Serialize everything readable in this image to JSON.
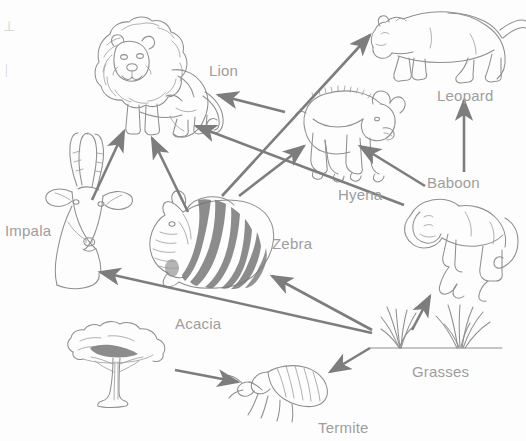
{
  "diagram": {
    "kind": "food-web",
    "width": 526,
    "height": 441,
    "background_color": "#ffffff",
    "line_color": "#7d7d7d",
    "label_color": "#9d9d9d",
    "partial_left_edge_marks": [
      "⊥",
      "|"
    ]
  },
  "labels": {
    "lion": "Lion",
    "leopard": "Leopard",
    "hyena": "Hyena",
    "baboon": "Baboon",
    "impala": "Impala",
    "zebra": "Zebra",
    "acacia": "Acacia",
    "grasses": "Grasses",
    "termite": "Termite"
  },
  "nodes": [
    {
      "id": "lion",
      "label": "Lion",
      "label_x": 209,
      "label_y": 62,
      "art_x": 90,
      "art_y": 18,
      "art_w": 125,
      "art_h": 120
    },
    {
      "id": "leopard",
      "label": "Leopard",
      "label_x": 437,
      "label_y": 87,
      "art_x": 368,
      "art_y": 2,
      "art_w": 150,
      "art_h": 82
    },
    {
      "id": "hyena",
      "label": "Hyena",
      "label_x": 338,
      "label_y": 186,
      "art_x": 305,
      "art_y": 86,
      "art_w": 100,
      "art_h": 95
    },
    {
      "id": "baboon",
      "label": "Baboon",
      "label_x": 427,
      "label_y": 174,
      "art_x": 392,
      "art_y": 192,
      "art_w": 120,
      "art_h": 110
    },
    {
      "id": "impala",
      "label": "Impala",
      "label_x": 5,
      "label_y": 222,
      "art_x": 44,
      "art_y": 170,
      "art_w": 95,
      "art_h": 115
    },
    {
      "id": "zebra",
      "label": "Zebra",
      "label_x": 272,
      "label_y": 235,
      "art_x": 152,
      "art_y": 198,
      "art_w": 115,
      "art_h": 85
    },
    {
      "id": "acacia",
      "label": "Acacia",
      "label_x": 175,
      "label_y": 315,
      "art_x": 64,
      "art_y": 318,
      "art_w": 115,
      "art_h": 85
    },
    {
      "id": "grasses",
      "label": "Grasses",
      "label_x": 412,
      "label_y": 363,
      "art_x": 368,
      "art_y": 310,
      "art_w": 135,
      "art_h": 80
    },
    {
      "id": "termite",
      "label": "Termite",
      "label_x": 318,
      "label_y": 419,
      "art_x": 228,
      "art_y": 358,
      "art_w": 110,
      "art_h": 60
    }
  ],
  "edges": [
    {
      "from": "impala",
      "to": "lion",
      "x1": 92,
      "y1": 200,
      "x2": 124,
      "y2": 131
    },
    {
      "from": "zebra",
      "to": "lion",
      "x1": 188,
      "y1": 212,
      "x2": 152,
      "y2": 138
    },
    {
      "from": "hyena",
      "to": "lion",
      "x1": 285,
      "y1": 112,
      "x2": 218,
      "y2": 95
    },
    {
      "from": "zebra",
      "to": "hyena",
      "x1": 239,
      "y1": 196,
      "x2": 304,
      "y2": 146
    },
    {
      "from": "impala",
      "to": "leopard",
      "x1": 222,
      "y1": 196,
      "x2": 370,
      "y2": 35
    },
    {
      "from": "baboon",
      "to": "leopard",
      "x1": 464,
      "y1": 172,
      "x2": 464,
      "y2": 100
    },
    {
      "from": "baboon",
      "to": "hyena",
      "x1": 425,
      "y1": 186,
      "x2": 360,
      "y2": 146
    },
    {
      "from": "baboon",
      "to": "lion",
      "x1": 404,
      "y1": 205,
      "x2": 196,
      "y2": 126
    },
    {
      "from": "grasses",
      "to": "baboon",
      "x1": 412,
      "y1": 330,
      "x2": 430,
      "y2": 296
    },
    {
      "from": "grasses",
      "to": "zebra",
      "x1": 372,
      "y1": 330,
      "x2": 272,
      "y2": 276
    },
    {
      "from": "grasses",
      "to": "impala",
      "x1": 372,
      "y1": 333,
      "x2": 100,
      "y2": 272
    },
    {
      "from": "grasses",
      "to": "termite",
      "x1": 370,
      "y1": 348,
      "x2": 330,
      "y2": 372
    },
    {
      "from": "acacia",
      "to": "termite",
      "x1": 175,
      "y1": 370,
      "x2": 238,
      "y2": 382
    }
  ]
}
